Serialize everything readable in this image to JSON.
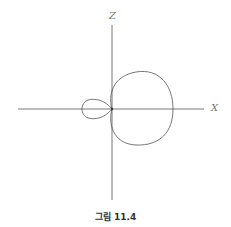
{
  "figure": {
    "caption": "그림 11.4",
    "axes": {
      "vertical_label": "Z",
      "horizontal_label": "X"
    },
    "curve": "limaçon-shaped polar plot with large lobe toward +X and small lobe toward −X",
    "colors": {
      "axis": "#555555",
      "curve": "#555555",
      "label": "#777777"
    }
  }
}
